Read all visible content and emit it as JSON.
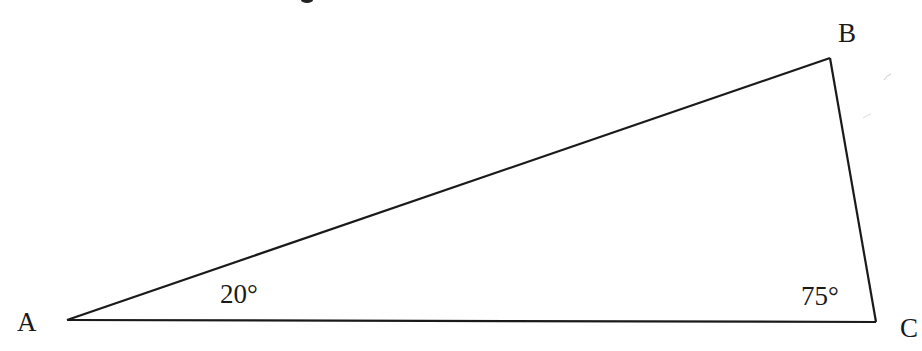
{
  "diagram": {
    "type": "triangle",
    "vertices": [
      {
        "name": "A",
        "x": 67,
        "y": 320
      },
      {
        "name": "B",
        "x": 830,
        "y": 58
      },
      {
        "name": "C",
        "x": 876,
        "y": 322
      }
    ],
    "vertex_labels": {
      "A": "A",
      "B": "B",
      "C": "C"
    },
    "angle_labels": {
      "A": "20°",
      "C": "75°"
    },
    "stroke_color": "#1a1a1a",
    "background": "#ffffff"
  }
}
